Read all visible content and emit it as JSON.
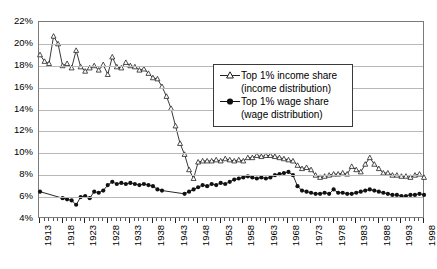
{
  "chart_data": {
    "type": "line",
    "title": "",
    "subtitle": "",
    "xlabel": "",
    "ylabel": "",
    "xlim": [
      1913,
      1998
    ],
    "ylim": [
      4,
      22
    ],
    "ytick_step": 2,
    "ytick_labels": [
      "22%",
      "20%",
      "18%",
      "16%",
      "14%",
      "12%",
      "10%",
      "8%",
      "6%",
      "4%"
    ],
    "ytick_values": [
      22,
      20,
      18,
      16,
      14,
      12,
      10,
      8,
      6,
      4
    ],
    "xtick_labels": [
      "1913",
      "1918",
      "1923",
      "1928",
      "1933",
      "1938",
      "1943",
      "1948",
      "1953",
      "1958",
      "1963",
      "1968",
      "1973",
      "1978",
      "1983",
      "1988",
      "1993",
      "1998"
    ],
    "xtick_values": [
      1913,
      1918,
      1923,
      1928,
      1933,
      1938,
      1943,
      1948,
      1953,
      1958,
      1963,
      1968,
      1973,
      1978,
      1983,
      1988,
      1993,
      1998
    ],
    "minor_ticks": "every year",
    "grid": "horizontal",
    "legend_position": "inside-upper-center-right",
    "units": "percent",
    "series": [
      {
        "name": "Top 1% income share",
        "sublabel": "(income distribution)",
        "marker": "open-triangle",
        "color": "#222222",
        "x": [
          1913,
          1914,
          1915,
          1916,
          1917,
          1918,
          1919,
          1920,
          1921,
          1922,
          1923,
          1924,
          1925,
          1926,
          1927,
          1928,
          1929,
          1930,
          1931,
          1932,
          1933,
          1934,
          1935,
          1936,
          1937,
          1938,
          1939,
          1940,
          1941,
          1942,
          1943,
          1944,
          1945,
          1946,
          1947,
          1948,
          1949,
          1950,
          1951,
          1952,
          1953,
          1954,
          1955,
          1956,
          1957,
          1958,
          1959,
          1960,
          1961,
          1962,
          1963,
          1964,
          1965,
          1966,
          1967,
          1968,
          1969,
          1970,
          1971,
          1972,
          1973,
          1974,
          1975,
          1976,
          1977,
          1978,
          1979,
          1980,
          1981,
          1982,
          1983,
          1984,
          1985,
          1986,
          1987,
          1988,
          1989,
          1990,
          1991,
          1992,
          1993,
          1994,
          1995,
          1996,
          1997,
          1998
        ],
        "values": [
          19.0,
          18.4,
          18.2,
          20.7,
          20.0,
          18.0,
          18.2,
          17.8,
          19.4,
          17.9,
          17.5,
          17.8,
          18.0,
          17.6,
          18.1,
          17.2,
          18.8,
          17.9,
          17.8,
          18.3,
          18.0,
          17.9,
          17.6,
          17.7,
          17.3,
          16.9,
          16.8,
          16.1,
          15.2,
          14.1,
          12.5,
          10.9,
          9.9,
          8.5,
          7.7,
          9.2,
          9.3,
          9.3,
          9.3,
          9.4,
          9.3,
          9.5,
          9.4,
          9.3,
          9.4,
          9.3,
          9.6,
          9.6,
          9.8,
          9.7,
          9.8,
          9.8,
          9.7,
          9.6,
          9.5,
          9.4,
          9.3,
          8.9,
          8.6,
          8.7,
          8.5,
          8.0,
          7.8,
          7.9,
          8.0,
          8.1,
          8.1,
          8.2,
          8.1,
          8.8,
          8.5,
          8.3,
          9.0,
          9.6,
          9.0,
          8.6,
          8.2,
          8.2,
          8.0,
          8.0,
          7.9,
          7.9,
          7.8,
          8.0,
          8.1,
          7.8
        ]
      },
      {
        "name": "Top 1% wage share",
        "sublabel": "(wage distribution)",
        "marker": "filled-circle",
        "color": "#111111",
        "x": [
          1913,
          1914,
          1915,
          1916,
          1917,
          1918,
          1919,
          1920,
          1921,
          1922,
          1923,
          1924,
          1925,
          1926,
          1927,
          1928,
          1929,
          1930,
          1931,
          1932,
          1933,
          1934,
          1935,
          1936,
          1937,
          1938,
          1939,
          1940,
          1941,
          1942,
          1943,
          1944,
          1945,
          1946,
          1947,
          1948,
          1949,
          1950,
          1951,
          1952,
          1953,
          1954,
          1955,
          1956,
          1957,
          1958,
          1959,
          1960,
          1961,
          1962,
          1963,
          1964,
          1965,
          1966,
          1967,
          1968,
          1969,
          1970,
          1971,
          1972,
          1973,
          1974,
          1975,
          1976,
          1977,
          1978,
          1979,
          1980,
          1981,
          1982,
          1983,
          1984,
          1985,
          1986,
          1987,
          1988,
          1989,
          1990,
          1991,
          1992,
          1993,
          1994,
          1995,
          1996,
          1997,
          1998
        ],
        "values": [
          6.5,
          null,
          null,
          null,
          null,
          5.9,
          5.8,
          5.7,
          5.3,
          6.0,
          6.1,
          5.9,
          6.5,
          6.4,
          6.6,
          7.1,
          7.4,
          7.2,
          7.3,
          7.2,
          7.3,
          7.2,
          7.1,
          7.2,
          7.1,
          7.0,
          6.7,
          6.6,
          null,
          null,
          null,
          null,
          6.3,
          6.5,
          6.7,
          6.9,
          7.1,
          7.0,
          7.2,
          7.1,
          7.3,
          7.2,
          7.4,
          7.6,
          7.7,
          7.8,
          7.9,
          7.8,
          7.7,
          7.8,
          7.7,
          7.8,
          8.0,
          8.1,
          8.2,
          8.3,
          8.0,
          7.0,
          6.6,
          6.5,
          6.4,
          6.3,
          6.3,
          6.4,
          6.3,
          6.7,
          6.4,
          6.4,
          6.3,
          6.3,
          6.4,
          6.5,
          6.6,
          6.7,
          6.6,
          6.5,
          6.4,
          6.3,
          6.2,
          6.2,
          6.1,
          6.1,
          6.2,
          6.2,
          6.3,
          6.2
        ],
        "gap_note": "no markers 1914-1917 and 1941-1944; line interpolated"
      }
    ]
  },
  "legend": {
    "items": [
      {
        "label": "Top 1% income share",
        "sublabel": "(income distribution)",
        "marker": "open-triangle"
      },
      {
        "label": "Top 1% wage share",
        "sublabel": "(wage distribution)",
        "marker": "filled-circle"
      }
    ]
  },
  "colors": {
    "grid": "#b8b8b8",
    "frame": "#7a7a7a",
    "series_income": "#222222",
    "series_wage": "#111111",
    "background": "#ffffff"
  }
}
